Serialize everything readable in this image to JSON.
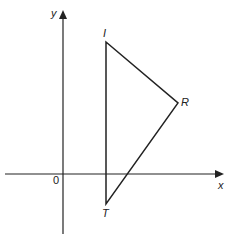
{
  "diagram": {
    "type": "coordinate-geometry",
    "axes": {
      "x_label": "x",
      "y_label": "y",
      "origin_label": "0"
    },
    "triangle": {
      "vertices": [
        {
          "name": "I",
          "label": "I"
        },
        {
          "name": "R",
          "label": "R"
        },
        {
          "name": "T",
          "label": "T"
        }
      ]
    },
    "colors": {
      "line": "#222222",
      "background": "#ffffff"
    }
  }
}
